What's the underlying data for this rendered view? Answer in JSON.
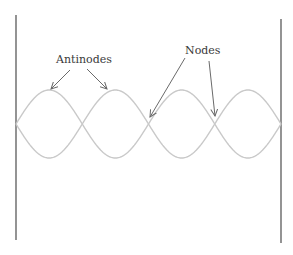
{
  "diagram": {
    "labels": {
      "antinodes": "Antinodes",
      "nodes": "Nodes"
    },
    "colors": {
      "wall": "#5a5a5a",
      "wave": "#c9c9c9",
      "arrow": "#6a6a6a",
      "text": "#3a3a3a"
    },
    "walls": [
      {
        "x": 16,
        "y1": 15,
        "y2": 240
      },
      {
        "x": 281,
        "y1": 19,
        "y2": 243
      }
    ],
    "wave": {
      "center_y": 124,
      "amplitude": 34,
      "x_start": 16,
      "x_end": 281,
      "loops": 4,
      "node_x": [
        16,
        81,
        149,
        214,
        281
      ]
    },
    "arrows": [
      {
        "name": "antinode-arrow-1",
        "from": [
          70,
          70
        ],
        "to": [
          51,
          89
        ]
      },
      {
        "name": "antinode-arrow-2",
        "from": [
          87,
          69
        ],
        "to": [
          107,
          89
        ]
      },
      {
        "name": "node-arrow-1",
        "from": [
          185,
          58
        ],
        "to": [
          150,
          117
        ]
      },
      {
        "name": "node-arrow-2",
        "from": [
          209,
          61
        ],
        "to": [
          215,
          116
        ]
      }
    ]
  }
}
